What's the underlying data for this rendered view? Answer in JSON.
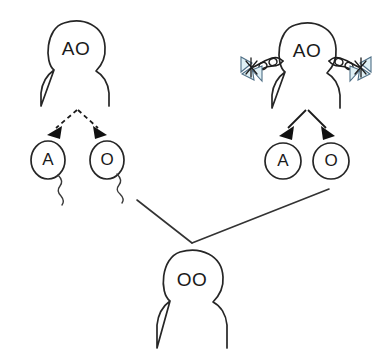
{
  "diagram": {
    "background_color": "#ffffff",
    "line_color": "#262626"
  },
  "parents": [
    {
      "id": "father",
      "name": "father-figure",
      "genotype": "AO",
      "sex": "male",
      "has_braids": false,
      "gamete_type": "sperm",
      "arrow_style": "dashed",
      "head": {
        "cx": 76,
        "cy": 49,
        "r": 28
      },
      "gametes": [
        {
          "label": "A",
          "name": "sperm-cell-a",
          "cx": 48,
          "cy": 160,
          "rx": 17,
          "ry": 19,
          "fill": "#d6d6d6",
          "stroke": "#2b2b2b",
          "has_tail": true
        },
        {
          "label": "O",
          "name": "sperm-cell-o",
          "cx": 107,
          "cy": 160,
          "rx": 17,
          "ry": 19,
          "fill": "#d6d6d6",
          "stroke": "#2b2b2b",
          "has_tail": true
        }
      ]
    },
    {
      "id": "mother",
      "name": "mother-figure",
      "genotype": "AO",
      "sex": "female",
      "has_braids": true,
      "gamete_type": "egg",
      "arrow_style": "solid",
      "head": {
        "cx": 307,
        "cy": 51,
        "r": 28
      },
      "bow_color": "#dff0f5",
      "bow_stroke": "#4f6f86",
      "gametes": [
        {
          "label": "A",
          "name": "egg-cell-a",
          "cx": 283,
          "cy": 161,
          "rx": 18,
          "ry": 18,
          "fill": "#e4f3f6",
          "stroke": "#2b2b2b",
          "has_tail": false
        },
        {
          "label": "O",
          "name": "egg-cell-o",
          "cx": 331,
          "cy": 161,
          "rx": 18,
          "ry": 18,
          "fill": "#e4f3f6",
          "stroke": "#2b2b2b",
          "has_tail": false
        }
      ]
    }
  ],
  "child": {
    "name": "child-figure",
    "genotype": "OO",
    "head": {
      "cx": 192,
      "cy": 279,
      "r": 29
    }
  },
  "fertilization": {
    "name": "fertilization-connectors",
    "junction": {
      "x": 192,
      "y": 243
    },
    "from_sperm": {
      "x": 137,
      "y": 200,
      "gamete": "O"
    },
    "from_egg": {
      "x": 329,
      "y": 189,
      "gamete": "O"
    }
  },
  "meiosis_arrows": {
    "father": {
      "apex": {
        "x": 77,
        "y": 110
      },
      "left_tip": {
        "x": 50,
        "y": 133
      },
      "right_tip": {
        "x": 104,
        "y": 133
      },
      "style": "dashed"
    },
    "mother": {
      "apex": {
        "x": 307,
        "y": 110
      },
      "left_tip": {
        "x": 282,
        "y": 133
      },
      "right_tip": {
        "x": 332,
        "y": 133
      },
      "style": "solid"
    }
  }
}
